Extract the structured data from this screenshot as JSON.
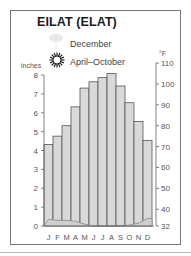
{
  "chart_data": {
    "type": "bar",
    "title": "EILAT (ELAT)",
    "categories": [
      "J",
      "F",
      "M",
      "A",
      "M",
      "J",
      "J",
      "A",
      "S",
      "O",
      "N",
      "D"
    ],
    "series": [
      {
        "name": "Average temperature (°F)",
        "axis": "right",
        "style": "bar",
        "values": [
          71,
          75,
          80,
          89,
          98,
          101,
          103,
          105,
          99,
          91,
          82,
          73
        ]
      },
      {
        "name": "Precipitation (inches)",
        "axis": "left",
        "style": "line",
        "values": [
          0.35,
          0.3,
          0.3,
          0.25,
          0.1,
          0,
          0,
          0,
          0,
          0.05,
          0.15,
          0.4
        ]
      }
    ],
    "left_axis": {
      "label": "inches",
      "ticks": [
        0,
        1,
        2,
        3,
        4,
        5,
        6,
        7,
        8
      ],
      "range": [
        0,
        8
      ]
    },
    "right_axis": {
      "label": "°F",
      "ticks": [
        32,
        40,
        50,
        60,
        70,
        80,
        90,
        100,
        110
      ],
      "range": [
        32,
        110
      ]
    },
    "legend": [
      {
        "icon": "rain-cloud-icon-faded",
        "label": "December"
      },
      {
        "icon": "sun-icon",
        "label": "April–October"
      }
    ],
    "grid": false
  },
  "labels": {
    "title": "EILAT (ELAT)",
    "legend_wet": "December",
    "legend_sun": "April–October",
    "left_unit": "inches",
    "right_unit": "°F"
  },
  "colors": {
    "bar_fill": "#d9d9d9",
    "bar_stroke": "#555555",
    "precip_fill": "#cfcfcf",
    "axis": "#666666",
    "text": "#333333"
  }
}
